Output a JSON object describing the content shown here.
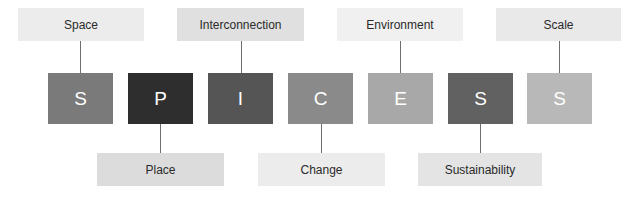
{
  "diagram": {
    "letters": [
      {
        "char": "S",
        "color": "#7a7a7a"
      },
      {
        "char": "P",
        "color": "#2e2e2e"
      },
      {
        "char": "I",
        "color": "#555555"
      },
      {
        "char": "C",
        "color": "#8a8a8a"
      },
      {
        "char": "E",
        "color": "#a8a8a8"
      },
      {
        "char": "S",
        "color": "#616161"
      },
      {
        "char": "S",
        "color": "#b8b8b8"
      }
    ],
    "top_labels": [
      {
        "text": "Space",
        "color": "#ececec"
      },
      {
        "text": "Interconnection",
        "color": "#e0e0e0"
      },
      {
        "text": "Environment",
        "color": "#f0f0f0"
      },
      {
        "text": "Scale",
        "color": "#e9e9e9"
      }
    ],
    "bottom_labels": [
      {
        "text": "Place",
        "color": "#dcdcdc"
      },
      {
        "text": "Change",
        "color": "#ececec"
      },
      {
        "text": "Sustainability",
        "color": "#e4e4e4"
      }
    ]
  }
}
